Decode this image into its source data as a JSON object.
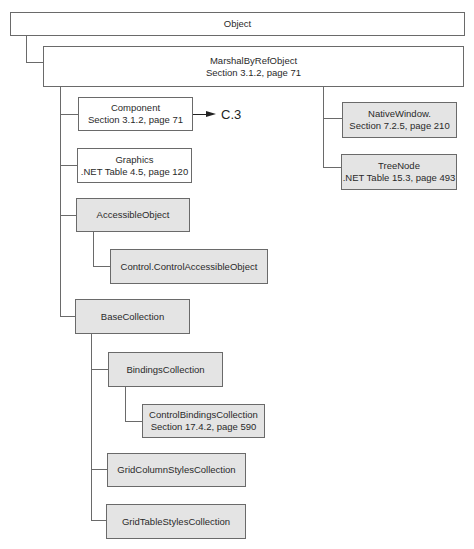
{
  "diagram": {
    "type": "class-hierarchy",
    "nodes": {
      "object": {
        "name": "Object",
        "ref": ""
      },
      "marshal": {
        "name": "MarshalByRefObject",
        "ref": "Section 3.1.2, page 71"
      },
      "component": {
        "name": "Component",
        "ref": "Section 3.1.2, page 71"
      },
      "graphics": {
        "name": "Graphics",
        "ref": ".NET Table 4.5, page 120"
      },
      "accessible": {
        "name": "AccessibleObject",
        "ref": ""
      },
      "control_accessible": {
        "name": "Control.ControlAccessibleObject",
        "ref": ""
      },
      "base_collection": {
        "name": "BaseCollection",
        "ref": ""
      },
      "bindings": {
        "name": "BindingsCollection",
        "ref": ""
      },
      "control_bindings": {
        "name": "ControlBindingsCollection",
        "ref": "Section 17.4.2, page 590"
      },
      "grid_column": {
        "name": "GridColumnStylesCollection",
        "ref": ""
      },
      "grid_table": {
        "name": "GridTableStylesCollection",
        "ref": ""
      },
      "native_window": {
        "name": "NativeWindow.",
        "ref": "Section 7.2.5, page 210"
      },
      "tree_node": {
        "name": "TreeNode",
        "ref": ".NET Table 15.3, page 493"
      }
    },
    "continuation": {
      "from": "Component",
      "label": "C.3"
    },
    "edges": [
      [
        "Object",
        "MarshalByRefObject"
      ],
      [
        "MarshalByRefObject",
        "Component"
      ],
      [
        "MarshalByRefObject",
        "Graphics"
      ],
      [
        "MarshalByRefObject",
        "AccessibleObject"
      ],
      [
        "MarshalByRefObject",
        "BaseCollection"
      ],
      [
        "MarshalByRefObject",
        "NativeWindow."
      ],
      [
        "MarshalByRefObject",
        "TreeNode"
      ],
      [
        "AccessibleObject",
        "Control.ControlAccessibleObject"
      ],
      [
        "BaseCollection",
        "BindingsCollection"
      ],
      [
        "BaseCollection",
        "GridColumnStylesCollection"
      ],
      [
        "BaseCollection",
        "GridTableStylesCollection"
      ],
      [
        "BindingsCollection",
        "ControlBindingsCollection"
      ]
    ],
    "colors": {
      "border": "#6a6a6a",
      "shaded_fill": "#e4e4e4",
      "plain_fill": "#ffffff"
    }
  }
}
